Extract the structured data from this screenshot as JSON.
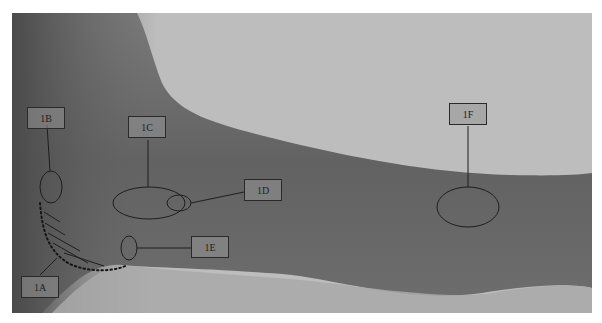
{
  "figure": {
    "labels": [
      {
        "id": "1A",
        "text": "1A"
      },
      {
        "id": "1B",
        "text": "1B"
      },
      {
        "id": "1C",
        "text": "1C"
      },
      {
        "id": "1D",
        "text": "1D"
      },
      {
        "id": "1E",
        "text": "1E"
      },
      {
        "id": "1F",
        "text": "1F"
      }
    ],
    "colors": {
      "background": "#bcbcbc",
      "arm": "#6f6f6f",
      "outline": "#1e1e1e"
    }
  }
}
